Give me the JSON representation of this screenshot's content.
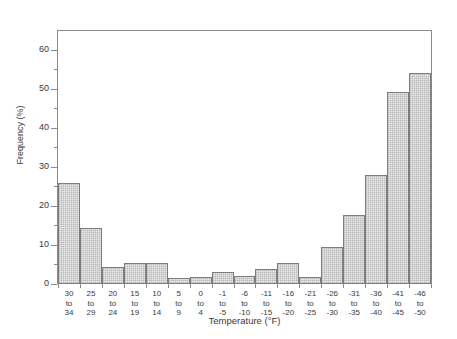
{
  "chart_data": {
    "type": "bar",
    "title": "",
    "xlabel": "Temperature (°F)",
    "ylabel": "Frequency (%)",
    "ylim": [
      0,
      65
    ],
    "ytick_major": [
      0,
      10,
      20,
      30,
      40,
      50,
      60
    ],
    "ytick_minor": [
      5,
      15,
      25,
      35,
      45,
      55
    ],
    "grid": false,
    "legend": null,
    "categories": [
      "30 to 34",
      "25 to 29",
      "20 to 24",
      "15 to 19",
      "10 to 14",
      "5 to 9",
      "0 to 4",
      "-1 to -5",
      "-6 to -10",
      "-11 to -15",
      "-16 to -20",
      "-21 to -25",
      "-26 to -30",
      "-31 to -35",
      "-36 to -40",
      "-41 to -45",
      "-46 to -50"
    ],
    "category_lines": [
      [
        "30",
        "to",
        "34"
      ],
      [
        "25",
        "to",
        "29"
      ],
      [
        "20",
        "to",
        "24"
      ],
      [
        "15",
        "to",
        "19"
      ],
      [
        "10",
        "to",
        "14"
      ],
      [
        "5",
        "to",
        "9"
      ],
      [
        "0",
        "to",
        "4"
      ],
      [
        "-1",
        "to",
        "-5"
      ],
      [
        "-6",
        "to",
        "-10"
      ],
      [
        "-11",
        "to",
        "-15"
      ],
      [
        "-16",
        "to",
        "-20"
      ],
      [
        "-21",
        "to",
        "-25"
      ],
      [
        "-26",
        "to",
        "-30"
      ],
      [
        "-31",
        "to",
        "-35"
      ],
      [
        "-36",
        "to",
        "-40"
      ],
      [
        "-41",
        "to",
        "-45"
      ],
      [
        "-46",
        "to",
        "-50"
      ]
    ],
    "values": [
      26.0,
      14.5,
      4.3,
      5.5,
      5.3,
      1.5,
      1.8,
      3.1,
      2.1,
      3.8,
      5.4,
      1.7,
      9.4,
      17.7,
      28.1,
      49.3,
      54.2
    ]
  },
  "style": {
    "bar_fill": "#e9e9e9",
    "bar_border": "#7d7d7d",
    "axis_color": "#8a8a8a",
    "text_color": "#3a3a3a",
    "background": "#ffffff"
  }
}
